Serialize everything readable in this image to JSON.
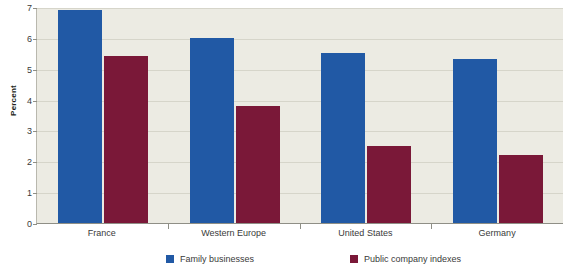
{
  "chart_data": {
    "type": "bar",
    "title": "",
    "xlabel": "",
    "ylabel": "Percent",
    "ylim": [
      0,
      7
    ],
    "yticks": [
      0,
      1,
      2,
      3,
      4,
      5,
      6,
      7
    ],
    "ytick_labels": [
      "0",
      "1",
      "2",
      "3",
      "4",
      "5",
      "6",
      "7"
    ],
    "grid": true,
    "legend_position": "bottom",
    "categories": [
      "France",
      "Western Europe",
      "United States",
      "Germany"
    ],
    "series": [
      {
        "name": "Family businesses",
        "color": "#2159a5",
        "values": [
          6.9,
          6.0,
          5.5,
          5.3
        ]
      },
      {
        "name": "Public company indexes",
        "color": "#7a1838",
        "values": [
          5.4,
          3.8,
          2.5,
          2.2
        ]
      }
    ]
  },
  "colors": {
    "series_blue": "#2159a5",
    "series_maroon": "#7a1838",
    "plot_background": "#ecebe3",
    "page_background": "#ffffff",
    "gridline": "#d6d5ca",
    "axis": "#8f8f86",
    "text": "#3a3a3a"
  }
}
